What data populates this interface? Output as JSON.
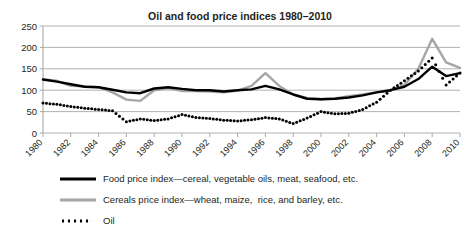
{
  "chart_data": {
    "type": "line",
    "title": "Oil and food price indices 1980–2010",
    "xlabel": "",
    "ylabel": "",
    "ylim": [
      0,
      250
    ],
    "yticks": [
      0,
      50,
      100,
      150,
      200,
      250
    ],
    "xlim": [
      1980,
      2010
    ],
    "xticks": [
      1980,
      1982,
      1984,
      1986,
      1988,
      1990,
      1992,
      1994,
      1996,
      1998,
      2000,
      2002,
      2004,
      2006,
      2008,
      2010
    ],
    "xtick_labels": [
      "1980",
      "1982",
      "1984",
      "1986",
      "1988",
      "1990",
      "1992",
      "1994",
      "1996",
      "1998",
      "2000",
      "2002",
      "2004",
      "2006",
      "2008",
      "2010"
    ],
    "grid": "horizontal",
    "legend_position": "bottom-left",
    "x": [
      1980,
      1981,
      1982,
      1983,
      1984,
      1985,
      1986,
      1987,
      1988,
      1989,
      1990,
      1991,
      1992,
      1993,
      1994,
      1995,
      1996,
      1997,
      1998,
      1999,
      2000,
      2001,
      2002,
      2003,
      2004,
      2005,
      2006,
      2007,
      2008,
      2009,
      2010
    ],
    "series": [
      {
        "name": "Food price index—cereal, vegetable oils, meat, seafood, etc.",
        "color": "#000000",
        "style": "solid",
        "values": [
          125,
          120,
          114,
          108,
          107,
          101,
          95,
          93,
          104,
          107,
          103,
          100,
          100,
          97,
          100,
          102,
          110,
          102,
          90,
          80,
          79,
          80,
          83,
          88,
          95,
          100,
          108,
          126,
          155,
          133,
          140
        ]
      },
      {
        "name": "Cereals price index—wheat, maize,  rice, and barley, etc.",
        "color": "#a6a6a6",
        "style": "solid",
        "values": [
          125,
          122,
          110,
          109,
          107,
          95,
          78,
          75,
          100,
          105,
          98,
          98,
          97,
          95,
          99,
          110,
          140,
          110,
          90,
          82,
          79,
          81,
          86,
          90,
          95,
          100,
          112,
          150,
          220,
          165,
          152
        ]
      },
      {
        "name": "Oil",
        "color": "#000000",
        "style": "dotted",
        "values": [
          70,
          67,
          62,
          58,
          55,
          52,
          26,
          33,
          29,
          33,
          43,
          36,
          34,
          30,
          28,
          31,
          36,
          33,
          22,
          35,
          50,
          45,
          46,
          55,
          72,
          100,
          122,
          145,
          175,
          112,
          140
        ]
      }
    ]
  },
  "legend": {
    "items": [
      {
        "label": "Food price index—cereal, vegetable oils, meat, seafood, etc.",
        "swatch": "solid-black"
      },
      {
        "label": "Cereals price index—wheat, maize,  rice, and barley, etc.",
        "swatch": "solid-grey"
      },
      {
        "label": "Oil",
        "swatch": "dotted-black"
      }
    ]
  },
  "colors": {
    "food": "#000000",
    "cereals": "#a6a6a6",
    "oil": "#000000",
    "grid": "#a7a9ac",
    "text": "#231f20",
    "background": "#ffffff"
  }
}
